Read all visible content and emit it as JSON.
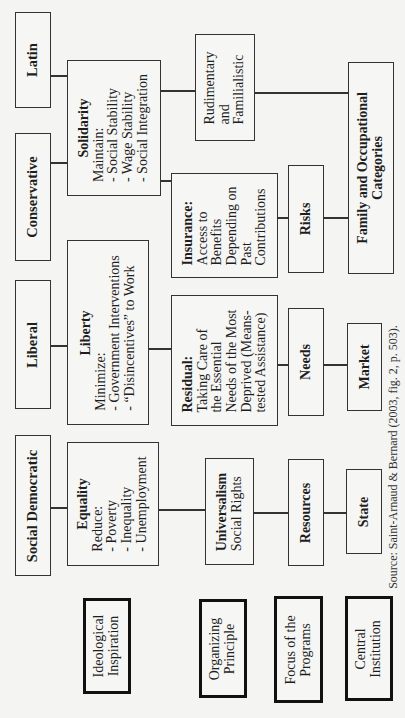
{
  "regimes": {
    "latin": "Latin",
    "conservative": "Conservative",
    "liberal": "Liberal",
    "social_democratic": "Social Democratic"
  },
  "ideological": {
    "solidarity": {
      "title": "Solidarity",
      "lines": [
        "Maintain:",
        "- Social Stability",
        "- Wage Stability",
        "- Social Integration"
      ]
    },
    "liberty": {
      "title": "Liberty",
      "lines": [
        "Minimize:",
        "- Government Interventions",
        "- “Disincentives” to Work"
      ]
    },
    "equality": {
      "title": "Equality",
      "lines": [
        "Reduce:",
        "- Poverty",
        "- Inequality",
        "- Unemployment"
      ]
    }
  },
  "organizing": {
    "rudimentary": [
      "Rudimentary",
      "and",
      "Familialistic"
    ],
    "insurance": {
      "title": "Insurance:",
      "lines": [
        "Access to",
        "Benefits",
        "Depending on",
        "Past",
        "Contributions"
      ]
    },
    "residual": {
      "title": "Residual:",
      "lines": [
        "Taking Care of",
        "the Essential",
        "Needs of the Most",
        "Deprived (Means-",
        "tested Assistance)"
      ]
    },
    "universalism": {
      "title": "Universalism",
      "lines": [
        "Social Rights"
      ]
    }
  },
  "focus": {
    "risks": "Risks",
    "needs": "Needs",
    "resources": "Resources"
  },
  "institution": {
    "family": [
      "Family and Occupational",
      "Categories"
    ],
    "market": "Market",
    "state": "State"
  },
  "legend": {
    "ideological_inspiration": [
      "Ideological",
      "Inspiration"
    ],
    "organizing_principle": [
      "Organizing",
      "Principle"
    ],
    "focus_of_programs": [
      "Focus of the",
      "Programs"
    ],
    "central_institution": [
      "Central",
      "Institution"
    ]
  },
  "source": "Source: Saint-Arnaud & Bernard (2003, fig. 2, p. 503)."
}
